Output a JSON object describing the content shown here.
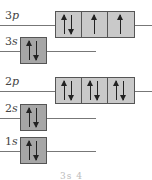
{
  "diagram": {
    "colors": {
      "s_box": "#a6a6a6",
      "p_box": "#c9c9c9",
      "line": "#777777",
      "arrow": "#222222"
    },
    "levels": [
      {
        "id": "3p",
        "n": "3",
        "l": "p",
        "y": 11,
        "orbitals": [
          [
            "up",
            "down"
          ],
          [
            "up"
          ],
          [
            "up"
          ]
        ]
      },
      {
        "id": "3s",
        "n": "3",
        "l": "s",
        "y": 37,
        "orbitals": [
          [
            "up",
            "down"
          ]
        ]
      },
      {
        "id": "2p",
        "n": "2",
        "l": "p",
        "y": 77,
        "orbitals": [
          [
            "up",
            "down"
          ],
          [
            "up",
            "down"
          ],
          [
            "up",
            "down"
          ]
        ]
      },
      {
        "id": "2s",
        "n": "2",
        "l": "s",
        "y": 104,
        "orbitals": [
          [
            "up",
            "down"
          ]
        ]
      },
      {
        "id": "1s",
        "n": "1",
        "l": "s",
        "y": 137,
        "orbitals": [
          [
            "up",
            "down"
          ]
        ]
      }
    ],
    "caption": "3s 4"
  }
}
